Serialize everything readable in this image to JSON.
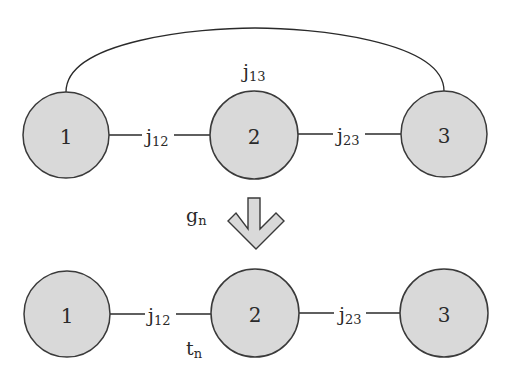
{
  "diagram": {
    "type": "graph-transformation",
    "colors": {
      "node_fill": "#d9d9d9",
      "node_stroke": "#3a3a3a",
      "edge": "#2a2a2a",
      "background": "#ffffff"
    },
    "top_graph": {
      "nodes": [
        {
          "id": "1",
          "label": "1"
        },
        {
          "id": "2",
          "label": "2"
        },
        {
          "id": "3",
          "label": "3"
        }
      ],
      "edges": [
        {
          "from": "1",
          "to": "2",
          "label_base": "j",
          "label_sub": "12"
        },
        {
          "from": "2",
          "to": "3",
          "label_base": "j",
          "label_sub": "23"
        },
        {
          "from": "1",
          "to": "3",
          "label_base": "j",
          "label_sub": "13",
          "style": "arc"
        }
      ]
    },
    "transformation": {
      "arrow": "down-arrow",
      "label_base": "g",
      "label_sub": "n"
    },
    "bottom_graph": {
      "nodes": [
        {
          "id": "1",
          "label": "1"
        },
        {
          "id": "2",
          "label": "2"
        },
        {
          "id": "3",
          "label": "3"
        }
      ],
      "edges": [
        {
          "from": "1",
          "to": "2",
          "label_base": "j",
          "label_sub": "12"
        },
        {
          "from": "2",
          "to": "3",
          "label_base": "j",
          "label_sub": "23"
        }
      ],
      "annotation": {
        "label_base": "t",
        "label_sub": "n"
      }
    }
  }
}
